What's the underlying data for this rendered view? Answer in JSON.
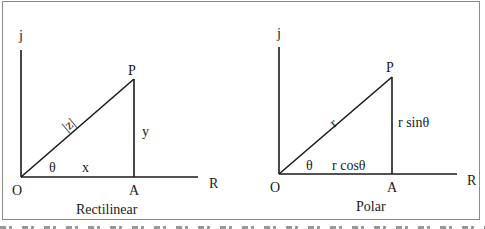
{
  "figure": {
    "panels": [
      {
        "title": "Rectilinear",
        "axis_vertical_label": "j",
        "axis_horizontal_label": "R",
        "origin_label": "O",
        "point_label": "P",
        "foot_label": "A",
        "hypotenuse_label": "|z|",
        "angle_label": "θ",
        "base_label": "x",
        "height_label": "y"
      },
      {
        "title": "Polar",
        "axis_vertical_label": "j",
        "axis_horizontal_label": "R",
        "origin_label": "O",
        "point_label": "P",
        "foot_label": "A",
        "hypotenuse_label": "r",
        "angle_label": "θ",
        "base_label": "r cosθ",
        "height_label": "r sinθ"
      }
    ],
    "colors": {
      "line": "#1a1a1a",
      "frame": "#8a8a8a",
      "background": "#ffffff"
    }
  }
}
